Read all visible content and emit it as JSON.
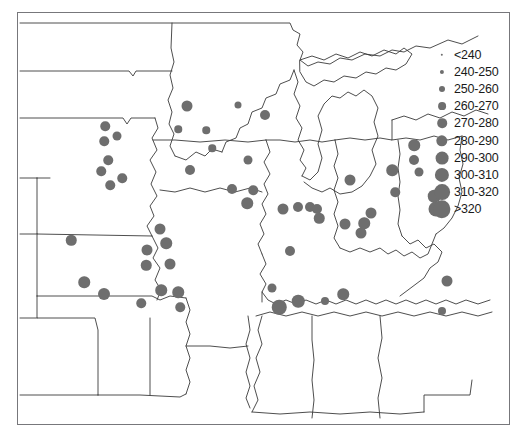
{
  "chart_data": {
    "type": "scatter",
    "title": "",
    "subtitle": "",
    "xlabel": "",
    "ylabel": "",
    "marker_color": "#6e6e6e",
    "map_line_color": "#3a3a3a",
    "frame_color": "#77777b",
    "legend": {
      "position": "top-right",
      "title": "",
      "classes": [
        {
          "label": "<240",
          "min": null,
          "max": 240,
          "marker_px": 2.4
        },
        {
          "label": "240-250",
          "min": 240,
          "max": 250,
          "marker_px": 4.2
        },
        {
          "label": "250-260",
          "min": 250,
          "max": 260,
          "marker_px": 6.0
        },
        {
          "label": "260-270",
          "min": 260,
          "max": 270,
          "marker_px": 7.8
        },
        {
          "label": "270-280",
          "min": 270,
          "max": 280,
          "marker_px": 9.6
        },
        {
          "label": "280-290",
          "min": 280,
          "max": 290,
          "marker_px": 11.4
        },
        {
          "label": "290-300",
          "min": 290,
          "max": 300,
          "marker_px": 12.8
        },
        {
          "label": "300-310",
          "min": 300,
          "max": 310,
          "marker_px": 14.2
        },
        {
          "label": "310-320",
          "min": 310,
          "max": 320,
          "marker_px": 15.8
        },
        {
          "label": ">320",
          "min": 320,
          "max": null,
          "marker_px": 17.4
        }
      ]
    },
    "points": [
      {
        "x": 105,
        "y": 126,
        "d": 9.5,
        "class": "270-280"
      },
      {
        "x": 104,
        "y": 141,
        "d": 9.5,
        "class": "270-280"
      },
      {
        "x": 117,
        "y": 136,
        "d": 9.0,
        "class": "270-280"
      },
      {
        "x": 108,
        "y": 160,
        "d": 9.5,
        "class": "270-280"
      },
      {
        "x": 101,
        "y": 171,
        "d": 9.5,
        "class": "270-280"
      },
      {
        "x": 122,
        "y": 178,
        "d": 9.5,
        "class": "270-280"
      },
      {
        "x": 110,
        "y": 185,
        "d": 9.5,
        "class": "270-280"
      },
      {
        "x": 71,
        "y": 240,
        "d": 10.5,
        "class": "280-290"
      },
      {
        "x": 84,
        "y": 282,
        "d": 11.5,
        "class": "280-290"
      },
      {
        "x": 104,
        "y": 294,
        "d": 12.0,
        "class": "280-290"
      },
      {
        "x": 147,
        "y": 250,
        "d": 11.0,
        "class": "280-290"
      },
      {
        "x": 146,
        "y": 265,
        "d": 10.5,
        "class": "280-290"
      },
      {
        "x": 160,
        "y": 229,
        "d": 11.0,
        "class": "280-290"
      },
      {
        "x": 166,
        "y": 243,
        "d": 11.5,
        "class": "280-290"
      },
      {
        "x": 170,
        "y": 264,
        "d": 11.0,
        "class": "280-290"
      },
      {
        "x": 161,
        "y": 290,
        "d": 11.5,
        "class": "280-290"
      },
      {
        "x": 178,
        "y": 292,
        "d": 11.5,
        "class": "280-290"
      },
      {
        "x": 141,
        "y": 303,
        "d": 9.5,
        "class": "270-280"
      },
      {
        "x": 180,
        "y": 307,
        "d": 9.5,
        "class": "270-280"
      },
      {
        "x": 187,
        "y": 106,
        "d": 11.0,
        "class": "280-290"
      },
      {
        "x": 178,
        "y": 129,
        "d": 7.5,
        "class": "260-270"
      },
      {
        "x": 206,
        "y": 130,
        "d": 7.5,
        "class": "260-270"
      },
      {
        "x": 190,
        "y": 170,
        "d": 10.0,
        "class": "270-280"
      },
      {
        "x": 212,
        "y": 148,
        "d": 7.5,
        "class": "260-270"
      },
      {
        "x": 238,
        "y": 105,
        "d": 7.0,
        "class": "260-270"
      },
      {
        "x": 265,
        "y": 115,
        "d": 10.0,
        "class": "270-280"
      },
      {
        "x": 232,
        "y": 189,
        "d": 10.0,
        "class": "270-280"
      },
      {
        "x": 248,
        "y": 160,
        "d": 9.0,
        "class": "270-280"
      },
      {
        "x": 253,
        "y": 190,
        "d": 9.5,
        "class": "270-280"
      },
      {
        "x": 247,
        "y": 203,
        "d": 11.5,
        "class": "280-290"
      },
      {
        "x": 290,
        "y": 251,
        "d": 10.0,
        "class": "270-280"
      },
      {
        "x": 283,
        "y": 209,
        "d": 11.0,
        "class": "280-290"
      },
      {
        "x": 298,
        "y": 207,
        "d": 10.0,
        "class": "270-280"
      },
      {
        "x": 310,
        "y": 207,
        "d": 10.0,
        "class": "270-280"
      },
      {
        "x": 317,
        "y": 209,
        "d": 10.0,
        "class": "270-280"
      },
      {
        "x": 319,
        "y": 218,
        "d": 10.5,
        "class": "280-290"
      },
      {
        "x": 350,
        "y": 180,
        "d": 11.0,
        "class": "280-290"
      },
      {
        "x": 345,
        "y": 224,
        "d": 11.0,
        "class": "280-290"
      },
      {
        "x": 364,
        "y": 223,
        "d": 11.5,
        "class": "280-290"
      },
      {
        "x": 371,
        "y": 213,
        "d": 11.0,
        "class": "280-290"
      },
      {
        "x": 392,
        "y": 170,
        "d": 11.5,
        "class": "280-290"
      },
      {
        "x": 414,
        "y": 160,
        "d": 10.0,
        "class": "270-280"
      },
      {
        "x": 395,
        "y": 192,
        "d": 9.5,
        "class": "270-280"
      },
      {
        "x": 419,
        "y": 172,
        "d": 9.0,
        "class": "270-280"
      },
      {
        "x": 414,
        "y": 145,
        "d": 11.5,
        "class": "280-290"
      },
      {
        "x": 434,
        "y": 196,
        "d": 12.5,
        "class": "290-300"
      },
      {
        "x": 436,
        "y": 209,
        "d": 15.0,
        "class": "310-320"
      },
      {
        "x": 361,
        "y": 233,
        "d": 11.0,
        "class": "280-290"
      },
      {
        "x": 279,
        "y": 307,
        "d": 14.5,
        "class": "300-310"
      },
      {
        "x": 298,
        "y": 301,
        "d": 12.5,
        "class": "290-300"
      },
      {
        "x": 325,
        "y": 301,
        "d": 8.0,
        "class": "260-270"
      },
      {
        "x": 343,
        "y": 294,
        "d": 11.5,
        "class": "280-290"
      },
      {
        "x": 447,
        "y": 281,
        "d": 11.0,
        "class": "280-290"
      },
      {
        "x": 442,
        "y": 311,
        "d": 8.0,
        "class": "260-270"
      },
      {
        "x": 272,
        "y": 288,
        "d": 9.0,
        "class": "270-280"
      }
    ]
  }
}
